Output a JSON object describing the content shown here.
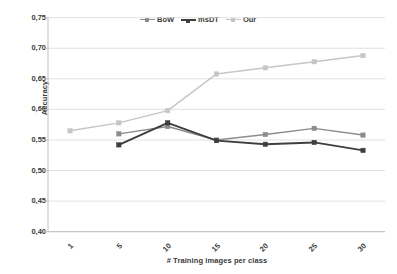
{
  "chart_data": {
    "type": "line",
    "title": "",
    "xlabel": "# Training images per class",
    "ylabel": "Accuracy",
    "x": [
      1,
      5,
      10,
      15,
      20,
      25,
      30
    ],
    "categories": [
      "1",
      "5",
      "10",
      "15",
      "20",
      "25",
      "30"
    ],
    "ylim": [
      0.4,
      0.75
    ],
    "yticks": [
      0.75,
      0.7,
      0.65,
      0.6,
      0.55,
      0.5,
      0.45,
      0.4
    ],
    "ytick_labels": [
      "0,75",
      "0,70",
      "0,65",
      "0,60",
      "0,55",
      "0,50",
      "0,45",
      "0,40"
    ],
    "grid": "horizontal",
    "legend_position": "top-center",
    "series": [
      {
        "name": "BoW",
        "color": "#8c8c8c",
        "x": [
          5,
          10,
          15,
          20,
          25,
          30
        ],
        "values": [
          0.56,
          0.572,
          0.55,
          0.559,
          0.569,
          0.558
        ]
      },
      {
        "name": "msDT",
        "color": "#3f3f3f",
        "x": [
          5,
          10,
          15,
          20,
          25,
          30
        ],
        "values": [
          0.542,
          0.578,
          0.549,
          0.543,
          0.546,
          0.533
        ]
      },
      {
        "name": "Our",
        "color": "#c6c6c6",
        "x": [
          1,
          5,
          10,
          15,
          20,
          25,
          30
        ],
        "values": [
          0.565,
          0.578,
          0.598,
          0.658,
          0.668,
          0.678,
          0.688
        ]
      }
    ]
  },
  "legend": {
    "items": [
      {
        "label": "BoW"
      },
      {
        "label": "msDT"
      },
      {
        "label": "Our"
      }
    ]
  },
  "axes": {
    "y_title": "Accuracy",
    "x_title": "# Training images per class"
  }
}
